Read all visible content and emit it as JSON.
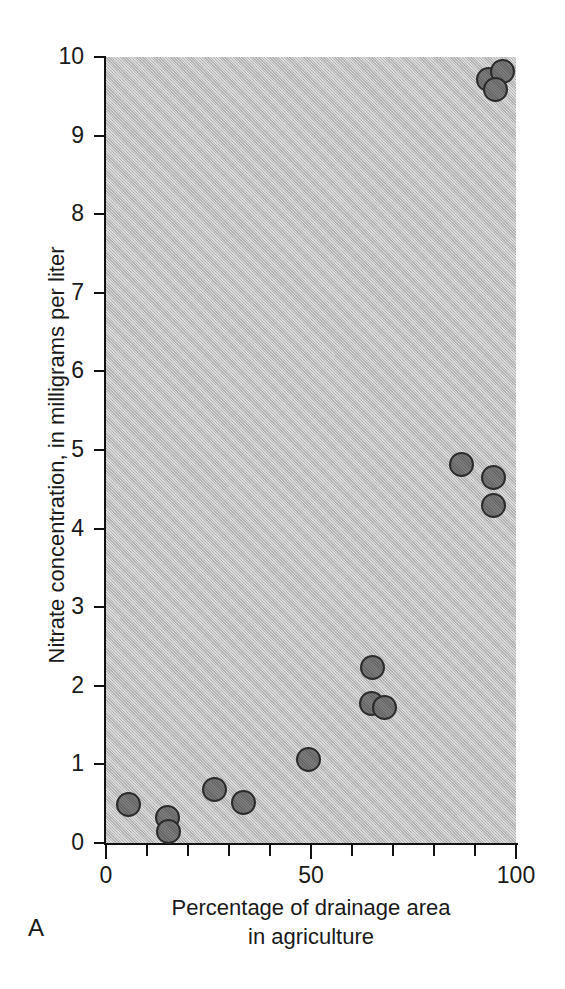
{
  "figure": {
    "panel_label": "A",
    "background_color": "#b9b9b9",
    "marker_fill_color": "#6d6d6d",
    "marker_edge_color": "#2b2b2b",
    "axis_color": "#111111"
  },
  "chart_data": {
    "type": "scatter",
    "title": "",
    "subtitle": "",
    "xlabel_line1": "Percentage of drainage area",
    "xlabel_line2": "in agriculture",
    "xlabel": "Percentage of drainage area in agriculture",
    "ylabel": "Nitrate concentration, in milligrams per liter",
    "xlim": [
      0,
      100
    ],
    "ylim": [
      0,
      10
    ],
    "grid": false,
    "legend": "none",
    "x_tick_labels": [
      "0",
      "50",
      "100"
    ],
    "x_tick_values": [
      0,
      50,
      100
    ],
    "x_minor_tick_values": [
      10,
      20,
      30,
      40,
      60,
      70,
      80,
      90
    ],
    "y_tick_labels": [
      "0",
      "1",
      "2",
      "3",
      "4",
      "5",
      "6",
      "7",
      "8",
      "9",
      "10"
    ],
    "y_tick_values": [
      0,
      1,
      2,
      3,
      4,
      5,
      6,
      7,
      8,
      9,
      10
    ],
    "series": [
      {
        "name": "Sampling sites",
        "points": [
          {
            "x": 5.5,
            "y": 0.49
          },
          {
            "x": 15.0,
            "y": 0.33
          },
          {
            "x": 15.2,
            "y": 0.15
          },
          {
            "x": 26.5,
            "y": 0.68
          },
          {
            "x": 33.5,
            "y": 0.51
          },
          {
            "x": 49.5,
            "y": 1.06
          },
          {
            "x": 65.0,
            "y": 2.23
          },
          {
            "x": 64.8,
            "y": 1.77
          },
          {
            "x": 68.0,
            "y": 1.73
          },
          {
            "x": 86.8,
            "y": 4.82
          },
          {
            "x": 94.4,
            "y": 4.65
          },
          {
            "x": 94.4,
            "y": 4.3
          },
          {
            "x": 93.4,
            "y": 9.72
          },
          {
            "x": 96.8,
            "y": 9.82
          },
          {
            "x": 95.1,
            "y": 9.59
          }
        ]
      }
    ]
  }
}
